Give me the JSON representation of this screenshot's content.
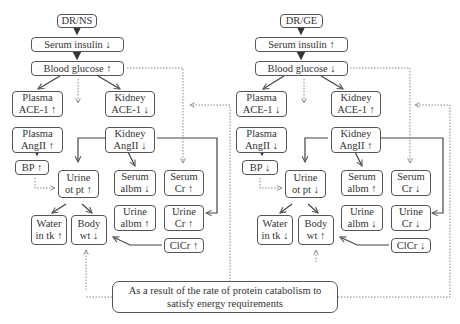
{
  "left": {
    "root": "DR/NS",
    "serum_insulin": "Serum insulin ↓",
    "blood_glucose": "Blood glucose ↑",
    "plasma_ace": "Plasma\nACE-1 ↑",
    "kidney_ace": "Kidney\nACE-1 ↓",
    "plasma_angii": "Plasma\nAngII ↑",
    "kidney_angii": "Kidney\nAngII ↓",
    "bp": "BP ↑",
    "urine_ot_pt": "Urine\not pt ↑",
    "serum_albm": "Serum\nalbm ↓",
    "serum_cr": "Serum\nCr ↑",
    "water_in_tk": "Water\nin tk ↑",
    "body_wt": "Body\nwt ↓",
    "urine_albm": "Urine\nalbm ↑",
    "urine_cr": "Urine\nCr ↑",
    "clcr": "ClCr ↑"
  },
  "right": {
    "root": "DR/GE",
    "serum_insulin": "Serum insulin ↑",
    "blood_glucose": "Blood glucose ↓",
    "plasma_ace": "Plasma\nACE-1 ↓",
    "kidney_ace": "Kidney\nACE-1 ↑",
    "plasma_angii": "Plasma\nAngII ↓",
    "kidney_angii": "Kidney\nAngII ↑",
    "bp": "BP ↓",
    "urine_ot_pt": "Urine\not pt ↓",
    "serum_albm": "Serum\nalbm ↑",
    "serum_cr": "Serum\nCr ↓",
    "water_in_tk": "Water\nin tk ↓",
    "body_wt": "Body\nwt ↑",
    "urine_albm": "Urine\nalbm ↓",
    "urine_cr": "Urine\nCr ↓",
    "clcr": "ClCr ↓"
  },
  "note": "As a result of the rate of protein catabolism to\nsatisfy energy requirements",
  "colors": {
    "line": "#555555",
    "dotted": "#888888",
    "text": "#333333"
  }
}
